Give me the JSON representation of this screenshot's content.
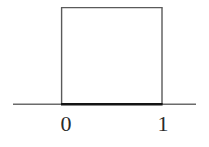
{
  "figure": {
    "title": "",
    "background_color": "#ffffff",
    "width": 209,
    "height": 147
  },
  "axis": {
    "name": "x-axis",
    "color": "#6b6b6b",
    "y_position": 104,
    "x_start": 13,
    "x_end": 196,
    "stroke_width": 1.6
  },
  "tick_labels": [
    {
      "text": "0",
      "value": 0,
      "x": 66
    },
    {
      "text": "1",
      "value": 1,
      "x": 163
    }
  ],
  "shape": {
    "name": "rectangle",
    "stroke_color": "#5a5a5a",
    "base_color": "#141414",
    "fill": "none",
    "left": 61,
    "right": 162,
    "top": 7,
    "bottom": 104,
    "stroke_width": 1.4,
    "base_stroke_width": 2.4
  },
  "chart_data": {
    "type": "area",
    "title": "",
    "subtitle": "",
    "xlabel": "",
    "ylabel": "",
    "x": [
      0,
      0,
      1,
      1
    ],
    "values": [
      0,
      1,
      1,
      0
    ],
    "series": [
      {
        "name": "uniform density",
        "x": [
          0,
          0,
          1,
          1
        ],
        "values": [
          0,
          1,
          1,
          0
        ]
      }
    ],
    "xlim": [
      -0.48,
      1.34
    ],
    "ylim": [
      0,
      1.1
    ],
    "xticks": [
      0,
      1
    ],
    "xticklabels": [
      "0",
      "1"
    ],
    "yticks": [],
    "yticklabels": [],
    "grid": false,
    "legend": false,
    "legend_position": "none",
    "annotations": []
  }
}
